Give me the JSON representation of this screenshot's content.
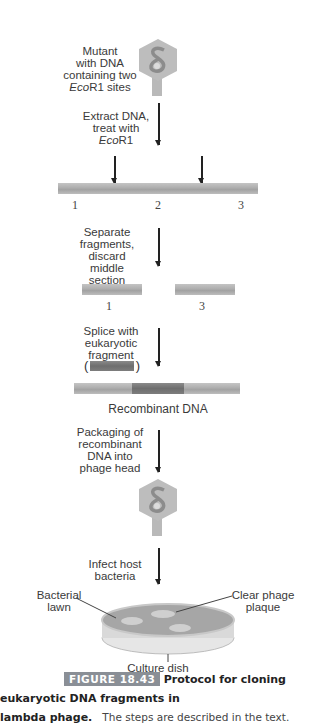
{
  "steps": {
    "mutant": [
      "Mutant",
      "with DNA",
      "containing two",
      "EcoR1 sites"
    ],
    "extract": [
      "Extract DNA,",
      "treat with",
      "EcoR1"
    ],
    "separate": [
      "Separate",
      "fragments,",
      "discard middle",
      "section"
    ],
    "splice": [
      "Splice with",
      "eukaryotic",
      "fragment"
    ],
    "packaging": [
      "Packaging of",
      "recombinant",
      "DNA into",
      "phage head"
    ],
    "infect": [
      "Infect host",
      "bacteria"
    ]
  },
  "dna_labels": {
    "full": [
      "1",
      "2",
      "3"
    ],
    "fragments": [
      "1",
      "3"
    ],
    "recombinant": "Recombinant DNA"
  },
  "dish_labels": {
    "lawn": [
      "Bacterial",
      "lawn"
    ],
    "plaque": [
      "Clear phage",
      "plaque"
    ],
    "dish": "Culture dish"
  },
  "caption": {
    "figure": "FIGURE 18.43",
    "title_part1": "Protocol for cloning eukaryotic DNA fragments in",
    "title_part2": "lambda phage.",
    "text": "The steps are described in the text."
  },
  "colors": {
    "phage": "#b9b9b9",
    "dna": "#b3b3b3",
    "eukaryotic": "#727272",
    "badge": "#8a8f96"
  }
}
